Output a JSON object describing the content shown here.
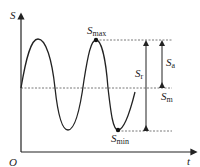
{
  "diagram": {
    "type": "sinusoidal stress-time cycle",
    "axes": {
      "y_label": "S",
      "x_label": "t",
      "origin_label": "O"
    },
    "labels": {
      "s_max": {
        "main": "S",
        "sub": "max"
      },
      "s_min": {
        "main": "S",
        "sub": "min"
      },
      "s_m": {
        "main": "S",
        "sub": "m"
      },
      "s_a": {
        "main": "S",
        "sub": "a"
      },
      "s_r": {
        "main": "S",
        "sub": "r"
      }
    },
    "colors": {
      "line": "#222222",
      "dashed": "#555555"
    }
  }
}
